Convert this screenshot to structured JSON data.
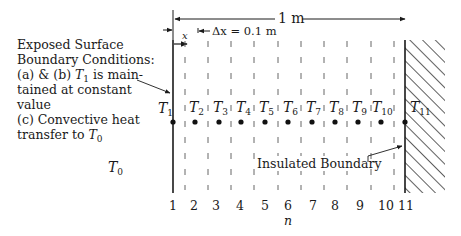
{
  "caption": {
    "line1": "Exposed Surface",
    "line2": "Boundary Conditions:",
    "line3_prefix": "(a) & (b) ",
    "line3_var": "T",
    "line3_sub": "1",
    "line3_suffix": " is main-",
    "line4": "tained at constant",
    "line5": "value",
    "line6": "(c) Convective heat",
    "line7_prefix": "transfer to ",
    "line7_var": "T",
    "line7_sub": "0"
  },
  "ambient_label": {
    "var": "T",
    "sub": "0"
  },
  "dimensions": {
    "total_length": "1 m",
    "dx_label": "Δx = 0.1 m",
    "x_label": "x"
  },
  "nodes": [
    {
      "n": "1",
      "label": "T",
      "sub": "1"
    },
    {
      "n": "2",
      "label": "T",
      "sub": "2"
    },
    {
      "n": "3",
      "label": "T",
      "sub": "3"
    },
    {
      "n": "4",
      "label": "T",
      "sub": "4"
    },
    {
      "n": "5",
      "label": "T",
      "sub": "5"
    },
    {
      "n": "6",
      "label": "T",
      "sub": "6"
    },
    {
      "n": "7",
      "label": "T",
      "sub": "7"
    },
    {
      "n": "8",
      "label": "T",
      "sub": "8"
    },
    {
      "n": "9",
      "label": "T",
      "sub": "9"
    },
    {
      "n": "10",
      "label": "T",
      "sub": "10"
    },
    {
      "n": "11",
      "label": "T",
      "sub": "11"
    }
  ],
  "insulated_label": "Insulated Boundary",
  "axis_label": "n"
}
